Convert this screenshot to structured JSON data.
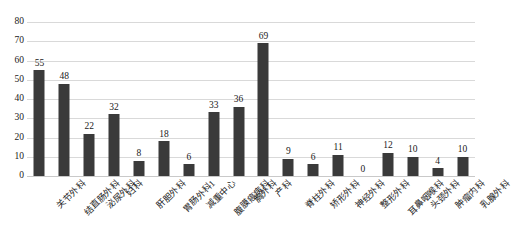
{
  "chart_data": {
    "type": "bar",
    "title": "",
    "xlabel": "",
    "ylabel": "",
    "ylim": [
      0,
      80
    ],
    "ytick_step": 10,
    "yticks": [
      80,
      70,
      60,
      50,
      40,
      30,
      20,
      10,
      0
    ],
    "grid": true,
    "legend": "none",
    "bar_color": "#3a3a3a",
    "gridline_color": "#d9d9d9",
    "background_color": "#ffffff",
    "categories": [
      "关节外科",
      "结直肠外科",
      "泌尿外科",
      "妇科",
      "肝胆外科",
      "胃肠外科1",
      "减重中心",
      "腹膜癌病科",
      "胸外科",
      "产科",
      "脊柱外科",
      "矫形外科",
      "神经外科",
      "整形外科",
      "耳鼻咽喉科",
      "头颈外科",
      "肿瘤内科",
      "乳腺外科"
    ],
    "values": [
      55,
      48,
      22,
      32,
      8,
      18,
      6,
      33,
      36,
      69,
      9,
      6,
      11,
      0,
      12,
      10,
      4,
      10
    ],
    "data_labels": [
      "55",
      "48",
      "22",
      "32",
      "8",
      "18",
      "6",
      "33",
      "36",
      "69",
      "9",
      "6",
      "11",
      "0",
      "12",
      "10",
      "4",
      "10"
    ]
  }
}
